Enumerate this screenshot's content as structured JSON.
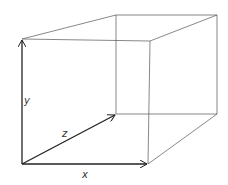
{
  "diagram": {
    "type": "3d-box-with-axes",
    "labels": {
      "x": "x",
      "y": "y",
      "z": "z"
    },
    "colors": {
      "edge": "#555555",
      "axis": "#222222",
      "background": "#ffffff"
    },
    "vertices": {
      "front_bottom_left": [
        22,
        164
      ],
      "front_top_left": [
        22,
        39
      ],
      "front_top_right": [
        150,
        41
      ],
      "front_bottom_right": [
        148,
        164
      ],
      "back_top_left": [
        116,
        15
      ],
      "back_top_right": [
        217,
        15
      ],
      "back_bottom_left": [
        116,
        114
      ],
      "back_bottom_right": [
        217,
        114
      ]
    }
  }
}
